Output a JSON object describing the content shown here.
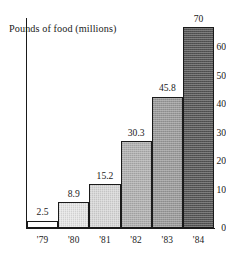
{
  "chart_data": {
    "type": "bar",
    "title": "Pounds of food (millions)",
    "xlabel": "",
    "ylabel": "Pounds of food (millions)",
    "categories": [
      "'79",
      "'80",
      "'81",
      "'82",
      "'83",
      "'84"
    ],
    "values": [
      2.5,
      8.9,
      15.2,
      30.3,
      45.8,
      70
    ],
    "value_labels": [
      "2.5",
      "8.9",
      "15.2",
      "30.3",
      "45.8",
      "70"
    ],
    "ylim": [
      0,
      70
    ],
    "yticks": [
      0,
      10,
      20,
      30,
      40,
      50,
      60
    ],
    "ytick_labels": [
      "0",
      "10",
      "20",
      "30",
      "40",
      "50",
      "60"
    ],
    "grid": false,
    "legend": null,
    "bar_fills": [
      "#ffffff",
      "#e6e6e6",
      "#d8d8d8",
      "#b0b0b0",
      "#9a9a9a",
      "#555555"
    ],
    "axis_color": "#1a1a1a",
    "background": "#ffffff"
  }
}
